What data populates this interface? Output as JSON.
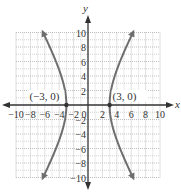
{
  "chart_data": {
    "type": "line",
    "title": "",
    "xlabel": "x",
    "ylabel": "y",
    "xlim": [
      -10,
      10
    ],
    "ylim": [
      -10,
      10
    ],
    "grid": true,
    "legend": null,
    "x_ticks": [
      -10,
      -8,
      -6,
      -4,
      -2,
      0,
      2,
      4,
      6,
      8,
      10
    ],
    "x_tick_labels": [
      "−10",
      "−8",
      "−6",
      "−4",
      "−2",
      "0",
      "2",
      "4",
      "6",
      "8",
      "10"
    ],
    "y_ticks": [
      -10,
      -8,
      -6,
      -4,
      -2,
      2,
      4,
      6,
      8,
      10
    ],
    "y_tick_labels": [
      "−10",
      "−8",
      "−6",
      "−4",
      "−2",
      "2",
      "4",
      "6",
      "8",
      "10"
    ],
    "curve": {
      "description": "Horizontal hyperbola opening left and right",
      "equation": "x^2/9 - y^2/30 = 1",
      "a": 3,
      "b_squared": 30,
      "branches": [
        {
          "name": "left-branch",
          "points": [
            [
              -6.2,
              -10
            ],
            [
              -5.2,
              -8
            ],
            [
              -4.5,
              -6
            ],
            [
              -3.7,
              -4
            ],
            [
              -3.2,
              -2
            ],
            [
              -3,
              0
            ],
            [
              -3.2,
              2
            ],
            [
              -3.7,
              4
            ],
            [
              -4.5,
              6
            ],
            [
              -5.2,
              8
            ],
            [
              -6.2,
              10
            ]
          ]
        },
        {
          "name": "right-branch",
          "points": [
            [
              6.2,
              -10
            ],
            [
              5.2,
              -8
            ],
            [
              4.5,
              -6
            ],
            [
              3.7,
              -4
            ],
            [
              3.2,
              -2
            ],
            [
              3,
              0
            ],
            [
              3.2,
              2
            ],
            [
              3.7,
              4
            ],
            [
              4.5,
              6
            ],
            [
              5.2,
              8
            ],
            [
              6.2,
              10
            ]
          ]
        }
      ]
    },
    "annotations": [
      {
        "text": "(−3, 0)",
        "x": -3,
        "y": 0,
        "marker": true
      },
      {
        "text": "(3, 0)",
        "x": 3,
        "y": 0,
        "marker": true
      }
    ],
    "colors": {
      "curve": "#6e6e6e",
      "axis": "#333333",
      "grid": "#b8b8b8",
      "point": "#333333"
    }
  }
}
